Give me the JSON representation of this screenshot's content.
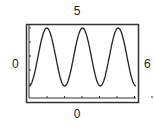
{
  "labels": {
    "top": "5",
    "left": "0",
    "right": "6",
    "bottom": "0"
  },
  "colors": {
    "frame": "#333333",
    "curve": "#222222",
    "background": "#ffffff"
  },
  "chart_data": {
    "type": "line",
    "title": "",
    "xlabel": "0",
    "ylabel": "0",
    "annotations": {
      "top": "5",
      "right": "6"
    },
    "x": [
      0,
      0.5,
      1,
      1.5,
      2,
      2.5,
      3,
      3.5,
      4,
      4.5,
      5,
      5.5,
      6
    ],
    "series": [
      {
        "name": "signal",
        "values": [
          0.0,
          0.5,
          1.0,
          0.5,
          0.0,
          0.5,
          1.0,
          0.5,
          0.0,
          0.5,
          1.0,
          0.5,
          0.0
        ]
      }
    ],
    "peaks": 3,
    "grid": false,
    "legend": null,
    "x_ticks": 7,
    "y_ticks": 5
  }
}
